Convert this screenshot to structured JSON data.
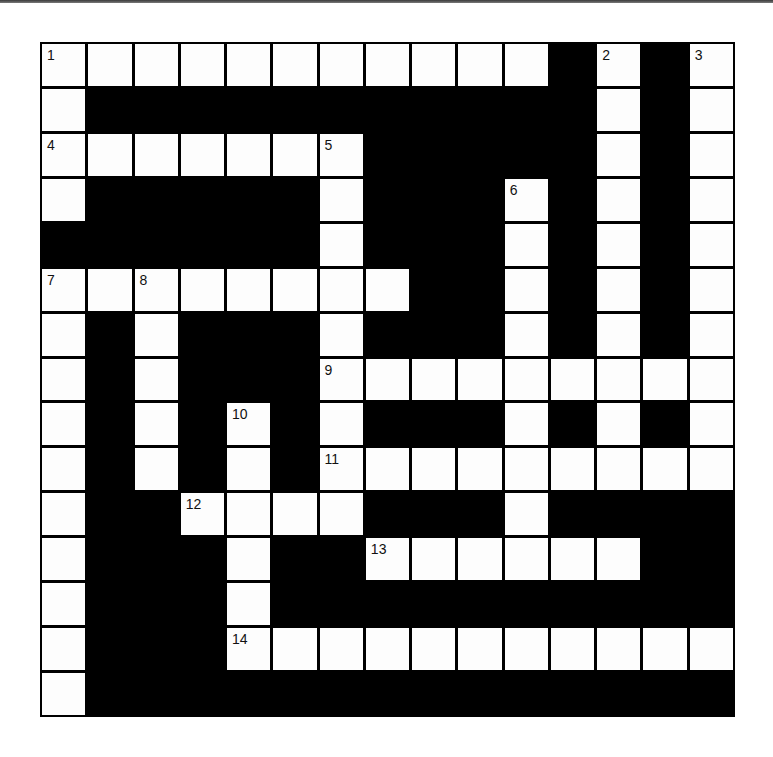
{
  "puzzle": {
    "rows": 15,
    "cols": 15,
    "grid": [
      "WWWWWWWWWWWBWBW",
      "WBBBBBBBBBBBWBW",
      "WWWWWWWBBBBBWBW",
      "WBBBBBWBBBWBWBW",
      "BBBBBBWBBBWBWBW",
      "WWWWWWWWBBWBWBW",
      "WBWBBBWBBBWBWBW",
      "WBWBBBWWWWWWWWW",
      "WBWBWBWBBBWBWBW",
      "WBWBWBWWWWWWWWW",
      "WBBWWWWBBBWBBBB",
      "WBBBWBBWWWWWWBB",
      "WBBBWBBBBBBBBBB",
      "WBBBWWWWWWWWWWW",
      "WBBBBBBBBBBBBBB"
    ],
    "numbers": [
      {
        "row": 0,
        "col": 0,
        "n": "1"
      },
      {
        "row": 0,
        "col": 12,
        "n": "2"
      },
      {
        "row": 0,
        "col": 14,
        "n": "3"
      },
      {
        "row": 2,
        "col": 0,
        "n": "4"
      },
      {
        "row": 2,
        "col": 6,
        "n": "5"
      },
      {
        "row": 3,
        "col": 10,
        "n": "6"
      },
      {
        "row": 5,
        "col": 0,
        "n": "7"
      },
      {
        "row": 5,
        "col": 2,
        "n": "8"
      },
      {
        "row": 7,
        "col": 6,
        "n": "9"
      },
      {
        "row": 8,
        "col": 4,
        "n": "10"
      },
      {
        "row": 9,
        "col": 6,
        "n": "11"
      },
      {
        "row": 10,
        "col": 3,
        "n": "12"
      },
      {
        "row": 11,
        "col": 7,
        "n": "13"
      },
      {
        "row": 13,
        "col": 4,
        "n": "14"
      }
    ],
    "colors": {
      "block": "#000000",
      "cell": "#fdfdfd",
      "number_text": "#111111"
    }
  }
}
